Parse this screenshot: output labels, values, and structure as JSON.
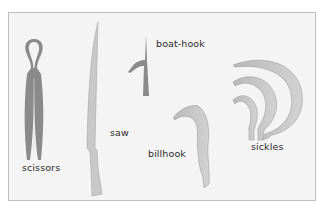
{
  "figure": {
    "labels": {
      "scissors": "scissors",
      "saw": "saw",
      "boat_hook": "boat-hook",
      "billhook": "billhook",
      "sickles": "sickles"
    },
    "colors": {
      "background": "#f4f4f4",
      "border": "#bdbdbd",
      "dark_tool": "#8a8a8a",
      "light_tool": "#c4c4c4",
      "tool_outline": "#9a9a9a",
      "text": "#2b2b2b"
    }
  }
}
